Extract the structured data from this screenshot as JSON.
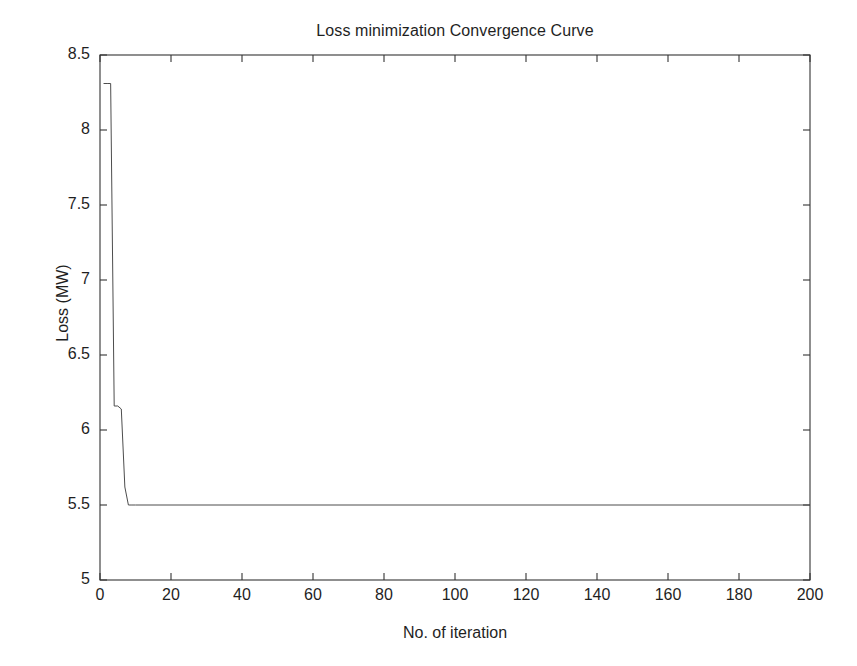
{
  "chart_data": {
    "type": "line",
    "title": "Loss minimization Convergence Curve",
    "xlabel": "No. of iteration",
    "ylabel": "Loss (MW)",
    "xlim": [
      0,
      200
    ],
    "ylim": [
      5,
      8.5
    ],
    "xticks": [
      0,
      20,
      40,
      60,
      80,
      100,
      120,
      140,
      160,
      180,
      200
    ],
    "xtick_labels": [
      "0",
      "20",
      "40",
      "60",
      "80",
      "100",
      "120",
      "140",
      "160",
      "180",
      "200"
    ],
    "yticks": [
      5,
      5.5,
      6,
      6.5,
      7,
      7.5,
      8,
      8.5
    ],
    "ytick_labels": [
      "5",
      "5.5",
      "6",
      "6.5",
      "7",
      "7.5",
      "8",
      "8.5"
    ],
    "grid": false,
    "legend": null,
    "line_color": "#4d4d4d",
    "line_width": 1,
    "series": [
      {
        "name": "Loss",
        "x": [
          1,
          2,
          3,
          4,
          5,
          6,
          7,
          8,
          9,
          10,
          20,
          40,
          60,
          80,
          100,
          120,
          140,
          160,
          180,
          200
        ],
        "values": [
          8.31,
          8.31,
          8.31,
          6.16,
          6.16,
          6.14,
          5.62,
          5.5,
          5.5,
          5.5,
          5.5,
          5.5,
          5.5,
          5.5,
          5.5,
          5.5,
          5.5,
          5.5,
          5.5,
          5.5
        ]
      }
    ],
    "annotations": []
  },
  "figure": {
    "background_color": "#ffffff",
    "axes_color": "#333333"
  }
}
